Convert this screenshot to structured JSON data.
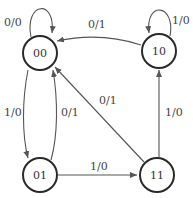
{
  "diagram": {
    "type": "state-machine",
    "states": [
      {
        "id": "s00",
        "label": "00"
      },
      {
        "id": "s10",
        "label": "10"
      },
      {
        "id": "s01",
        "label": "01"
      },
      {
        "id": "s11",
        "label": "11"
      }
    ],
    "transitions": [
      {
        "from": "00",
        "to": "00",
        "label": "0/0"
      },
      {
        "from": "10",
        "to": "00",
        "label": "0/1"
      },
      {
        "from": "10",
        "to": "10",
        "label": "1/0"
      },
      {
        "from": "00",
        "to": "01",
        "label": "1/0"
      },
      {
        "from": "01",
        "to": "00",
        "label": "0/1"
      },
      {
        "from": "11",
        "to": "00",
        "label": "0/1"
      },
      {
        "from": "11",
        "to": "10",
        "label": "1/0"
      },
      {
        "from": "01",
        "to": "11",
        "label": "1/0"
      }
    ]
  }
}
